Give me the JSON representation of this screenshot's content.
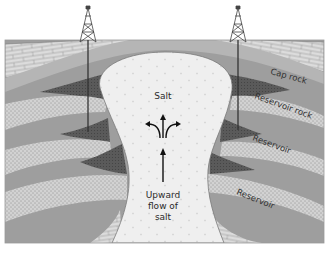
{
  "diagram": {
    "labels": {
      "salt": "Salt",
      "upward_flow_line1": "Upward",
      "upward_flow_line2": "flow of",
      "upward_flow_line3": "salt",
      "cap_rock": "Cap rock",
      "reservoir_rock": "Reservoir rock",
      "reservoir_1": "Reservoir",
      "reservoir_2": "Reservoir"
    },
    "elements": {
      "derricks": [
        "left-derrick",
        "right-derrick"
      ],
      "wells": [
        "left-well",
        "right-well"
      ],
      "arrows": [
        "upward-arrow",
        "diverging-arrows"
      ]
    },
    "colors": {
      "background": "#ffffff",
      "salt": "#efefef",
      "limestone": "#d9d9d9",
      "shale": "#9a9a9a",
      "shale_light": "#b0b0b0",
      "sandstone": "#cfcfcf",
      "oil_trap": "#555555",
      "outline": "#555555"
    }
  }
}
